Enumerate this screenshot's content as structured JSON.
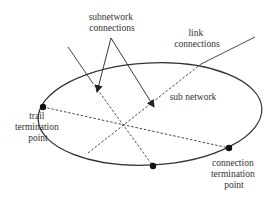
{
  "diagram": {
    "labels": {
      "subnetwork_connections_line1": "subnetwork",
      "subnetwork_connections_line2": "connections",
      "link_connections_line1": "link",
      "link_connections_line2": "connections",
      "sub_network": "sub network",
      "trail_termination_line1": "trail",
      "trail_termination_line2": "termination",
      "trail_termination_line3": "point",
      "connection_termination_line1": "connection",
      "connection_termination_line2": "termination",
      "connection_termination_line3": "point"
    },
    "colors": {
      "stroke": "#333333",
      "text": "#333333",
      "background": "#ffffff"
    }
  }
}
